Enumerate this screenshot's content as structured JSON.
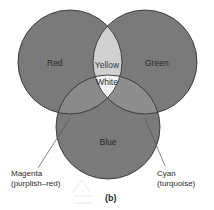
{
  "figure": {
    "panel_label": "(b)",
    "colors": {
      "primary_fill": "#7a7a7a",
      "pair_overlap_fill": "#8e8e8e",
      "yellow_fill": "#d0d0d0",
      "white_fill": "#f4f4f4",
      "stroke": "#333333",
      "leader_line": "#555555"
    },
    "circles": {
      "red": {
        "label": "Red"
      },
      "green": {
        "label": "Green"
      },
      "blue": {
        "label": "Blue"
      }
    },
    "overlaps": {
      "yellow": {
        "label": "Yellow"
      },
      "white": {
        "label": "White"
      },
      "magenta": {
        "label_line1": "Magenta",
        "label_line2": "(purplish–red)"
      },
      "cyan": {
        "label_line1": "Cyan",
        "label_line2": "(turquoise)"
      }
    }
  }
}
